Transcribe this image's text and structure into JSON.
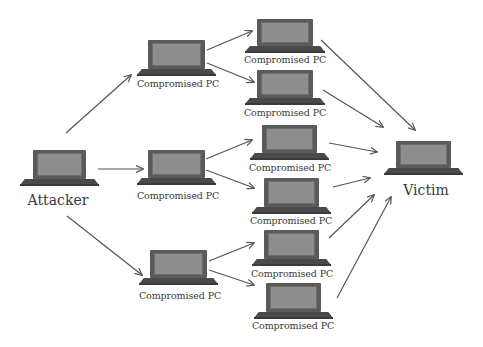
{
  "diagram": {
    "type": "network-attack-topology",
    "nodes": {
      "attacker": {
        "label": "Attacker",
        "icon": "laptop-icon"
      },
      "tier1": [
        {
          "label": "Compromised PC",
          "icon": "laptop-icon"
        },
        {
          "label": "Compromised PC",
          "icon": "laptop-icon"
        },
        {
          "label": "Compromised PC",
          "icon": "laptop-icon"
        }
      ],
      "tier2": [
        {
          "label": "Compromised PC",
          "icon": "laptop-icon"
        },
        {
          "label": "Compromised PC",
          "icon": "laptop-icon"
        },
        {
          "label": "Compromised PC",
          "icon": "laptop-icon"
        },
        {
          "label": "Compromised PC",
          "icon": "laptop-icon"
        },
        {
          "label": "Compromised PC",
          "icon": "laptop-icon"
        },
        {
          "label": "Compromised PC",
          "icon": "laptop-icon"
        }
      ],
      "victim": {
        "label": "Victim",
        "icon": "laptop-icon"
      }
    },
    "edges": [
      {
        "from": "Attacker",
        "to": "Compromised PC (tier1 #1)"
      },
      {
        "from": "Attacker",
        "to": "Compromised PC (tier1 #2)"
      },
      {
        "from": "Attacker",
        "to": "Compromised PC (tier1 #3)"
      },
      {
        "from": "tier1 #1",
        "to": "tier2 #1"
      },
      {
        "from": "tier1 #1",
        "to": "tier2 #2"
      },
      {
        "from": "tier1 #2",
        "to": "tier2 #3"
      },
      {
        "from": "tier1 #2",
        "to": "tier2 #4"
      },
      {
        "from": "tier1 #3",
        "to": "tier2 #5"
      },
      {
        "from": "tier1 #3",
        "to": "tier2 #6"
      },
      {
        "from": "tier2 #1",
        "to": "Victim"
      },
      {
        "from": "tier2 #2",
        "to": "Victim"
      },
      {
        "from": "tier2 #3",
        "to": "Victim"
      },
      {
        "from": "tier2 #4",
        "to": "Victim"
      },
      {
        "from": "tier2 #5",
        "to": "Victim"
      },
      {
        "from": "tier2 #6",
        "to": "Victim"
      }
    ],
    "colors": {
      "background": "#ffffff",
      "arrow": "#555555",
      "laptop_body": "#4a4a4a",
      "laptop_screen": "#8e8e8e",
      "label_text": "#3a3a3a"
    }
  }
}
